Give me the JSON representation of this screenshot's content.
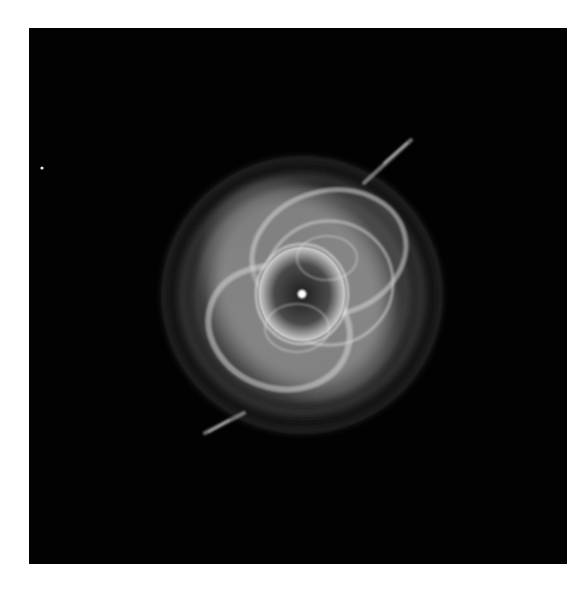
{
  "image": {
    "subject": "Cat's Eye Nebula",
    "style": "grayscale astronomical photograph",
    "background_color": "#020202",
    "page_color": "#ffffff",
    "frame": {
      "x": 29,
      "y": 28,
      "width": 538,
      "height": 536
    }
  }
}
